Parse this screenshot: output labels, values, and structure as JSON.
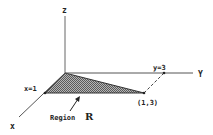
{
  "diagram": {
    "type": "3d-axes-region",
    "axes": {
      "z_label": "z",
      "y_label": "Y",
      "x_label": "x"
    },
    "points": {
      "x_intercept_label": "x=1",
      "y_intercept_label": "y=3",
      "corner_label": "(1,3)"
    },
    "region": {
      "label_prefix": "Region",
      "label_name": "R",
      "fill_color": "#8a8a8a",
      "description": "Triangular shaded region with vertices (0,0), (1,0), (1,3) in the xy-plane"
    },
    "colors": {
      "line": "#555555",
      "text": "#222222",
      "background": "#ffffff"
    }
  }
}
